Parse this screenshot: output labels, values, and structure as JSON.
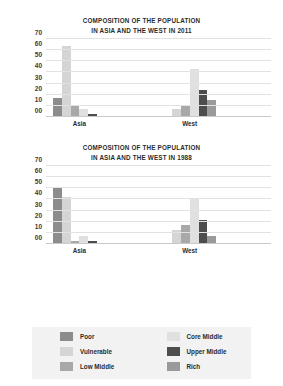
{
  "legend": {
    "columns": [
      [
        {
          "label": "Poor",
          "color": "#8c8c8c"
        },
        {
          "label": "Vulnerable",
          "color": "#d5d5d5"
        },
        {
          "label": "Low Middle",
          "color": "#a8a8a8"
        }
      ],
      [
        {
          "label": "Core Middle",
          "color": "#e0e0e0"
        },
        {
          "label": "Upper Middle",
          "color": "#4d4d4d"
        },
        {
          "label": "Rich",
          "color": "#9a9a9a"
        }
      ]
    ]
  },
  "chart_data": [
    {
      "type": "bar",
      "title": "COMPOSITION OF THE POPULATION IN ASIA AND THE WEST IN 2011",
      "title_line1": "COMPOSITION OF THE POPULATION",
      "title_line2": "IN ASIA AND THE WEST IN 2011",
      "xlabel": "",
      "ylabel": "",
      "ylim": [
        0,
        70
      ],
      "grid": true,
      "legend_position": "bottom",
      "ytick_labels": [
        "70",
        "60",
        "50",
        "40",
        "30",
        "20",
        "10",
        "00"
      ],
      "ytick_values": [
        70,
        60,
        50,
        40,
        30,
        20,
        10,
        0
      ],
      "categories": [
        "Asia",
        "West"
      ],
      "series": [
        {
          "name": "Poor",
          "color": "#8c8c8c",
          "values": [
            17,
            1
          ]
        },
        {
          "name": "Vulnerable",
          "color": "#d5d5d5",
          "values": [
            64,
            7
          ]
        },
        {
          "name": "Low Middle",
          "color": "#a8a8a8",
          "values": [
            10,
            10
          ]
        },
        {
          "name": "Core Middle",
          "color": "#e0e0e0",
          "values": [
            7,
            43
          ]
        },
        {
          "name": "Upper Middle",
          "color": "#4d4d4d",
          "values": [
            3,
            24
          ]
        },
        {
          "name": "Rich",
          "color": "#9a9a9a",
          "values": [
            1,
            15
          ]
        }
      ]
    },
    {
      "type": "bar",
      "title": "COMPOSITION OF THE POPULATION IN ASIA AND THE WEST IN 1988",
      "title_line1": "COMPOSITION OF THE POPULATION",
      "title_line2": "IN ASIA AND THE WEST IN 1988",
      "xlabel": "",
      "ylabel": "",
      "ylim": [
        0,
        70
      ],
      "grid": true,
      "legend_position": "bottom",
      "ytick_labels": [
        "70",
        "60",
        "50",
        "40",
        "30",
        "20",
        "10",
        "00"
      ],
      "ytick_values": [
        70,
        60,
        50,
        40,
        30,
        20,
        10,
        0
      ],
      "categories": [
        "Asia",
        "West"
      ],
      "series": [
        {
          "name": "Poor",
          "color": "#8c8c8c",
          "values": [
            50,
            1
          ]
        },
        {
          "name": "Vulnerable",
          "color": "#d5d5d5",
          "values": [
            42,
            13
          ]
        },
        {
          "name": "Low Middle",
          "color": "#a8a8a8",
          "values": [
            3,
            17
          ]
        },
        {
          "name": "Core Middle",
          "color": "#e0e0e0",
          "values": [
            7,
            40
          ]
        },
        {
          "name": "Upper Middle",
          "color": "#4d4d4d",
          "values": [
            3,
            22
          ]
        },
        {
          "name": "Rich",
          "color": "#9a9a9a",
          "values": [
            1,
            7
          ]
        }
      ]
    }
  ]
}
